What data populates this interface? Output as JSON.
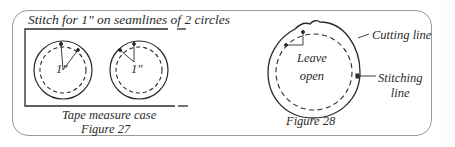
{
  "figure27": {
    "instruction": "Stitch for 1\" on seamlines of 2 circles",
    "measure_label_left": "1\"",
    "measure_label_right": "1\"",
    "caption_line1": "Tape measure case",
    "caption_line2": "Figure 27"
  },
  "figure28": {
    "leave_open_line1": "Leave",
    "leave_open_line2": "open",
    "cutting_line_label": "Cutting line",
    "stitching_line_label_line1": "Stitching",
    "stitching_line_label_line2": "line",
    "caption": "Figure 28"
  },
  "colors": {
    "ink": "#2a2a2a",
    "frame": "#9a9a9a",
    "background": "#ffffff"
  }
}
